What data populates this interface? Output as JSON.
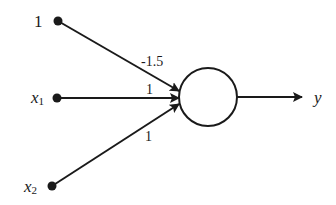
{
  "diagram": {
    "type": "perceptron",
    "colors": {
      "stroke": "#1a1a1a",
      "background": "#ffffff"
    },
    "inputs": [
      {
        "label": "1",
        "var": "",
        "sub": "",
        "weight": "-1.5"
      },
      {
        "label": "",
        "var": "x",
        "sub": "1",
        "weight": "1"
      },
      {
        "label": "",
        "var": "x",
        "sub": "2",
        "weight": "1"
      }
    ],
    "neuron": {
      "shape": "circle"
    },
    "output": {
      "var": "y"
    }
  }
}
